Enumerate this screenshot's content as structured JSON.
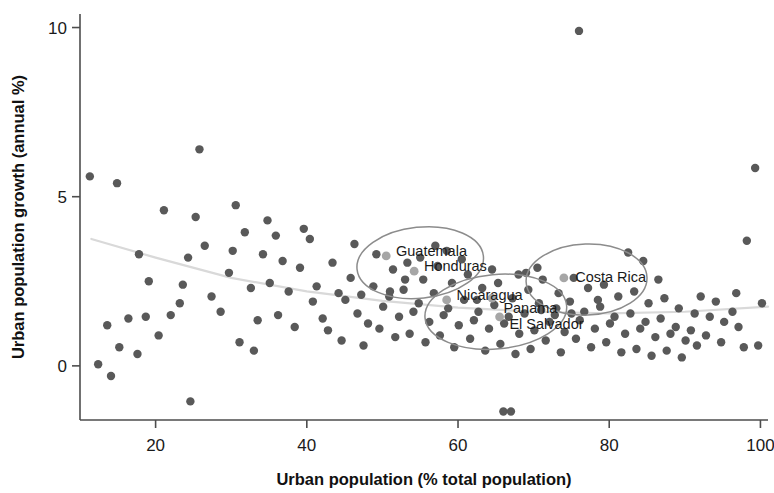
{
  "chart_data": {
    "type": "scatter",
    "title": "",
    "xlabel": "Urban population (% total population)",
    "ylabel": "Urban population growth (annual %)",
    "xlim": [
      10,
      101
    ],
    "ylim": [
      -1.6,
      10.4
    ],
    "xticks": [
      20,
      40,
      60,
      80,
      100
    ],
    "yticks": [
      0,
      5,
      10
    ],
    "xtick_labels": [
      "20",
      "40",
      "60",
      "80",
      "100"
    ],
    "ytick_labels": [
      "0",
      "5",
      "10"
    ],
    "grid": false,
    "legend": "none",
    "point_color": "#595959",
    "highlight_color": "#a6a6a6",
    "trendline_color": "#d9d9d9",
    "ellipse_color": "#8c8c8c",
    "axis_color": "#4d4d4d",
    "series": [
      {
        "name": "countries",
        "points": [
          [
            11.3,
            5.6
          ],
          [
            14.9,
            5.4
          ],
          [
            21.1,
            4.6
          ],
          [
            17.8,
            3.3
          ],
          [
            19.1,
            2.5
          ],
          [
            16.4,
            1.4
          ],
          [
            13.6,
            1.2
          ],
          [
            15.2,
            0.55
          ],
          [
            17.6,
            0.35
          ],
          [
            12.4,
            0.05
          ],
          [
            14.1,
            -0.3
          ],
          [
            18.7,
            1.45
          ],
          [
            20.4,
            0.9
          ],
          [
            22.0,
            1.5
          ],
          [
            23.6,
            2.4
          ],
          [
            24.6,
            -1.05
          ],
          [
            25.8,
            6.4
          ],
          [
            25.3,
            4.4
          ],
          [
            26.5,
            3.55
          ],
          [
            24.3,
            3.2
          ],
          [
            27.4,
            2.05
          ],
          [
            23.2,
            1.85
          ],
          [
            28.6,
            1.6
          ],
          [
            29.7,
            2.75
          ],
          [
            30.6,
            4.75
          ],
          [
            31.8,
            3.95
          ],
          [
            30.2,
            3.4
          ],
          [
            32.6,
            2.3
          ],
          [
            33.5,
            1.35
          ],
          [
            31.1,
            0.7
          ],
          [
            34.8,
            4.3
          ],
          [
            35.9,
            3.85
          ],
          [
            34.2,
            3.3
          ],
          [
            36.8,
            3.1
          ],
          [
            35.1,
            2.45
          ],
          [
            37.6,
            2.2
          ],
          [
            36.2,
            1.5
          ],
          [
            38.4,
            1.15
          ],
          [
            33.0,
            0.45
          ],
          [
            39.6,
            4.05
          ],
          [
            40.4,
            3.75
          ],
          [
            39.1,
            2.9
          ],
          [
            41.3,
            2.35
          ],
          [
            40.8,
            1.9
          ],
          [
            42.1,
            1.4
          ],
          [
            43.4,
            3.05
          ],
          [
            44.2,
            2.15
          ],
          [
            42.8,
            1.05
          ],
          [
            45.1,
            1.95
          ],
          [
            44.6,
            0.75
          ],
          [
            46.3,
            3.6
          ],
          [
            45.8,
            2.6
          ],
          [
            47.2,
            2.1
          ],
          [
            46.7,
            1.55
          ],
          [
            48.1,
            1.25
          ],
          [
            47.5,
            0.6
          ],
          [
            49.2,
            3.3
          ],
          [
            48.8,
            2.35
          ],
          [
            50.1,
            1.75
          ],
          [
            49.6,
            1.1
          ],
          [
            51.4,
            2.85
          ],
          [
            50.9,
            2.05
          ],
          [
            52.2,
            1.45
          ],
          [
            51.7,
            0.85
          ],
          [
            53.3,
            3.05
          ],
          [
            52.8,
            2.25
          ],
          [
            54.1,
            1.6
          ],
          [
            53.6,
            0.95
          ],
          [
            55.4,
            2.55
          ],
          [
            54.8,
            1.85
          ],
          [
            56.2,
            1.3
          ],
          [
            55.7,
            0.7
          ],
          [
            57.3,
            2.95
          ],
          [
            56.8,
            2.15
          ],
          [
            58.1,
            1.5
          ],
          [
            57.6,
            0.9
          ],
          [
            59.2,
            2.45
          ],
          [
            58.7,
            1.7
          ],
          [
            60.1,
            1.2
          ],
          [
            59.5,
            0.55
          ],
          [
            61.3,
            2.7
          ],
          [
            60.8,
            1.95
          ],
          [
            62.1,
            1.35
          ],
          [
            61.6,
            0.8
          ],
          [
            63.2,
            2.3
          ],
          [
            62.7,
            1.6
          ],
          [
            64.1,
            1.1
          ],
          [
            63.6,
            0.45
          ],
          [
            65.3,
            2.45
          ],
          [
            64.8,
            1.8
          ],
          [
            66.1,
            1.25
          ],
          [
            65.6,
            0.65
          ],
          [
            67.2,
            2.0
          ],
          [
            66.7,
            1.45
          ],
          [
            68.1,
            0.95
          ],
          [
            67.6,
            0.35
          ],
          [
            66.0,
            -1.35
          ],
          [
            67.0,
            -1.35
          ],
          [
            69.3,
            2.25
          ],
          [
            68.8,
            1.55
          ],
          [
            70.1,
            1.05
          ],
          [
            69.6,
            0.5
          ],
          [
            71.2,
            2.55
          ],
          [
            70.7,
            1.85
          ],
          [
            72.1,
            1.3
          ],
          [
            71.6,
            0.75
          ],
          [
            73.3,
            2.15
          ],
          [
            72.8,
            1.5
          ],
          [
            74.1,
            1.0
          ],
          [
            73.6,
            0.4
          ],
          [
            75.3,
            2.6
          ],
          [
            74.8,
            1.9
          ],
          [
            76.1,
            1.35
          ],
          [
            75.6,
            0.8
          ],
          [
            76.0,
            9.9
          ],
          [
            77.2,
            2.3
          ],
          [
            76.7,
            1.6
          ],
          [
            78.1,
            1.1
          ],
          [
            77.6,
            0.55
          ],
          [
            79.3,
            2.4
          ],
          [
            78.8,
            1.75
          ],
          [
            80.1,
            1.25
          ],
          [
            79.6,
            0.7
          ],
          [
            81.2,
            2.05
          ],
          [
            80.7,
            1.45
          ],
          [
            82.1,
            0.95
          ],
          [
            81.6,
            0.4
          ],
          [
            83.3,
            2.2
          ],
          [
            82.8,
            1.55
          ],
          [
            84.1,
            1.1
          ],
          [
            83.6,
            0.5
          ],
          [
            85.2,
            1.85
          ],
          [
            84.8,
            1.3
          ],
          [
            86.1,
            0.85
          ],
          [
            85.6,
            0.3
          ],
          [
            87.3,
            2.0
          ],
          [
            86.8,
            1.4
          ],
          [
            88.1,
            0.95
          ],
          [
            87.6,
            0.45
          ],
          [
            89.2,
            1.7
          ],
          [
            88.8,
            1.15
          ],
          [
            90.1,
            0.75
          ],
          [
            89.6,
            0.25
          ],
          [
            91.3,
            1.55
          ],
          [
            90.8,
            1.05
          ],
          [
            92.1,
            2.05
          ],
          [
            91.6,
            0.6
          ],
          [
            93.3,
            1.45
          ],
          [
            92.8,
            0.9
          ],
          [
            94.1,
            1.9
          ],
          [
            95.2,
            1.3
          ],
          [
            94.8,
            0.7
          ],
          [
            96.3,
            1.6
          ],
          [
            97.1,
            1.15
          ],
          [
            98.2,
            3.7
          ],
          [
            99.3,
            5.85
          ],
          [
            100.2,
            1.85
          ],
          [
            99.7,
            0.6
          ],
          [
            97.8,
            0.55
          ],
          [
            96.8,
            2.15
          ],
          [
            84.5,
            3.1
          ],
          [
            86.5,
            2.55
          ],
          [
            82.5,
            3.35
          ],
          [
            68.0,
            2.7
          ],
          [
            69.0,
            2.75
          ],
          [
            70.5,
            2.9
          ],
          [
            57.0,
            3.55
          ],
          [
            55.0,
            3.2
          ],
          [
            58.5,
            3.4
          ],
          [
            60.5,
            3.15
          ],
          [
            53.0,
            2.55
          ],
          [
            51.0,
            2.2
          ],
          [
            62.5,
            1.95
          ],
          [
            64.5,
            2.85
          ],
          [
            71.0,
            1.65
          ],
          [
            73.0,
            1.7
          ],
          [
            75.0,
            1.55
          ],
          [
            78.5,
            1.95
          ]
        ]
      },
      {
        "name": "highlighted-countries",
        "points": [
          {
            "label": "Guatemala",
            "x": 50.5,
            "y": 3.25
          },
          {
            "label": "Honduras",
            "x": 54.2,
            "y": 2.8
          },
          {
            "label": "Nicaragua",
            "x": 58.5,
            "y": 1.95
          },
          {
            "label": "Panama",
            "x": 64.5,
            "y": 2.0
          },
          {
            "label": "El Salvador",
            "x": 65.5,
            "y": 1.45
          },
          {
            "label": "Costa Rica",
            "x": 74.0,
            "y": 2.6
          }
        ]
      }
    ],
    "annotations": [
      {
        "text": "Guatemala",
        "x": 51.8,
        "y": 3.4
      },
      {
        "text": "Honduras",
        "x": 55.5,
        "y": 2.95
      },
      {
        "text": "Nicaragua",
        "x": 59.8,
        "y": 2.1
      },
      {
        "text": "Panama",
        "x": 66.0,
        "y": 1.7
      },
      {
        "text": "El Salvador",
        "x": 66.8,
        "y": 1.25
      },
      {
        "text": "Costa Rica",
        "x": 75.5,
        "y": 2.62
      }
    ],
    "ellipses": [
      {
        "name": "guatemala-honduras-ellipse",
        "cx": 55.0,
        "cy": 3.05,
        "rx": 8.4,
        "ry": 1.05,
        "rotation": -6
      },
      {
        "name": "nicaragua-panama-salvador-ellipse",
        "cx": 65.0,
        "cy": 1.6,
        "rx": 9.4,
        "ry": 1.1,
        "rotation": -5
      },
      {
        "name": "costa-rica-ellipse",
        "cx": 77.0,
        "cy": 2.55,
        "rx": 8.0,
        "ry": 1.05,
        "rotation": -2
      }
    ],
    "trendline": {
      "name": "fitted-trend",
      "points": [
        [
          11.5,
          3.75
        ],
        [
          20,
          3.2
        ],
        [
          30,
          2.6
        ],
        [
          40,
          2.2
        ],
        [
          50,
          1.92
        ],
        [
          60,
          1.72
        ],
        [
          70,
          1.6
        ],
        [
          80,
          1.55
        ],
        [
          90,
          1.6
        ],
        [
          101,
          1.75
        ]
      ]
    }
  }
}
